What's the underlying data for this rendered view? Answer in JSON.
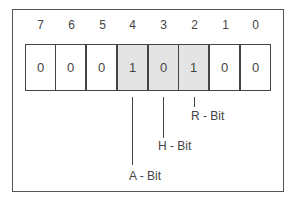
{
  "diagram": {
    "bit_indices": [
      "7",
      "6",
      "5",
      "4",
      "3",
      "2",
      "1",
      "0"
    ],
    "bit_values": [
      "0",
      "0",
      "0",
      "1",
      "0",
      "1",
      "0",
      "0"
    ],
    "shaded_bits": [
      4,
      3,
      2
    ],
    "shade_color": "#e4e4e4",
    "labels": {
      "r_bit": "R - Bit",
      "h_bit": "H - Bit",
      "a_bit": "A - Bit"
    }
  }
}
